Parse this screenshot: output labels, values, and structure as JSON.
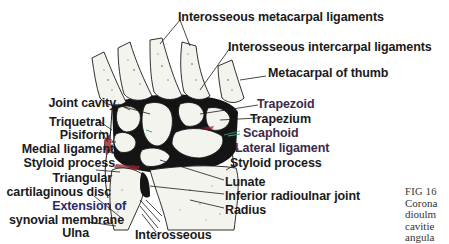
{
  "figure": {
    "type": "anatomical-diagram",
    "colors": {
      "joint_cavity": "#141414",
      "bone_fill": "#f4f4ee",
      "synovial_red": "#a0202a",
      "accent_green": "#3aaa88",
      "label_text": "#1a1a1a"
    }
  },
  "labels": {
    "top": [
      {
        "id": "interosseous-metacarpal-ligaments",
        "text": "Interosseous metacarpal ligaments"
      },
      {
        "id": "interosseous-intercarpal-ligaments",
        "text": "Interosseous intercarpal ligaments"
      },
      {
        "id": "metacarpal-of-thumb",
        "text": "Metacarpal of thumb"
      }
    ],
    "left": [
      {
        "id": "joint-cavity",
        "text": "Joint cavity"
      },
      {
        "id": "triquetral",
        "text": "Triquetral"
      },
      {
        "id": "pisiform",
        "text": "Pisiform"
      },
      {
        "id": "medial-ligament",
        "text": "Medial ligament"
      },
      {
        "id": "styloid-process-ulna",
        "text": "Styloid process"
      },
      {
        "id": "triangular",
        "text": "Triangular"
      },
      {
        "id": "cartilaginous-disc",
        "text": "cartilaginous disc"
      },
      {
        "id": "extension-of",
        "text": "Extension of"
      },
      {
        "id": "synovial-membrane",
        "text": "synovial membrane"
      },
      {
        "id": "ulna",
        "text": "Ulna"
      }
    ],
    "right": [
      {
        "id": "trapezoid",
        "text": "Trapezoid"
      },
      {
        "id": "trapezium",
        "text": "Trapezium"
      },
      {
        "id": "scaphoid",
        "text": "Scaphoid"
      },
      {
        "id": "lateral-ligament",
        "text": "Lateral ligament"
      },
      {
        "id": "styloid-process-radius",
        "text": "Styloid process"
      },
      {
        "id": "lunate",
        "text": "Lunate"
      },
      {
        "id": "inferior-radioulnar-joint",
        "text": "Inferior radioulnar joint"
      },
      {
        "id": "radius",
        "text": "Radius"
      }
    ],
    "bottom": [
      {
        "id": "interosseous",
        "text": "Interosseous"
      }
    ]
  },
  "caption": {
    "lines": [
      "FIG 16",
      "Corona",
      "dioulm",
      "cavitie",
      "angula"
    ]
  }
}
